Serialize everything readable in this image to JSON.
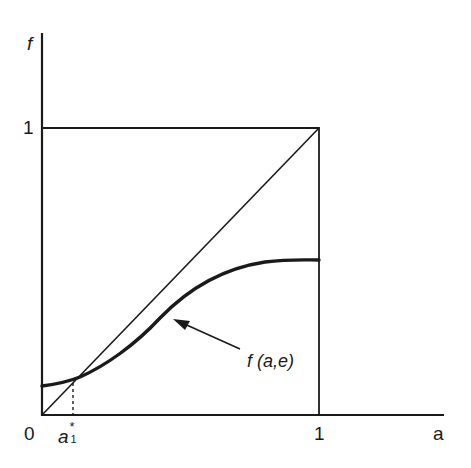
{
  "diagram": {
    "y_axis_label": "f",
    "x_axis_label": "a",
    "y_tick_one": "1",
    "x_tick_zero": "0",
    "x_tick_one": "1",
    "a_star_base": "a",
    "a_star_sup": "*",
    "a_star_sub": "1",
    "curve_label": "f (a,e)",
    "elements": [
      "y-axis",
      "x-axis",
      "unit-square",
      "45-degree-line",
      "curve f(a,e)",
      "dashed line at a1*",
      "arrow pointing to curve"
    ]
  }
}
